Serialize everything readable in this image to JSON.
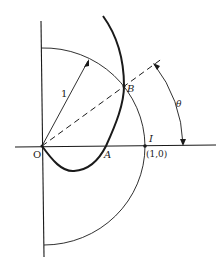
{
  "figure": {
    "labels": {
      "origin": "O",
      "point_a": "A",
      "point_b": "B",
      "point_i": "I",
      "point_i_coords": "(1,0)",
      "radius": "1",
      "angle": "θ"
    },
    "colors": {
      "ink": "#1a1a1a",
      "background": "#ffffff"
    },
    "elements": {
      "unit_circle": "semicircle of radius 1 centered at origin (right half)",
      "curve": "bold curve through O, A, B",
      "ray": "dashed ray from O through B at angle θ",
      "angle_arc": "arc with arrowheads marking θ from x-axis to ray"
    }
  }
}
